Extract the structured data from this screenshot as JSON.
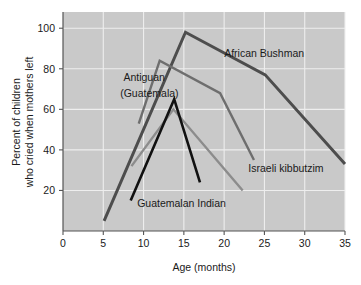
{
  "chart_data": {
    "type": "line",
    "title": "",
    "xlabel": "Age (months)",
    "ylabel": "Percent of children\nwho cried when mothers left",
    "ylabel_line1": "Percent of children",
    "ylabel_line2": "who cried when mothers left",
    "xlim": [
      0,
      35
    ],
    "ylim": [
      0,
      108
    ],
    "xticks": [
      0,
      5,
      10,
      15,
      20,
      25,
      30,
      35
    ],
    "xtick_labels": [
      "0",
      "5",
      "10",
      "15",
      "20",
      "25",
      "30",
      "35"
    ],
    "yticks": [
      20,
      40,
      60,
      80,
      100
    ],
    "ytick_labels": [
      "20",
      "40",
      "60",
      "80",
      "100"
    ],
    "grid": "both",
    "legend_position": "inline-annotations",
    "plot_background": "#c9c9c9",
    "series": [
      {
        "name": "African Bushman",
        "color": "#4d4d4d",
        "width": 3.0,
        "points": [
          [
            5.1,
            5
          ],
          [
            15.2,
            98
          ],
          [
            25.1,
            77
          ],
          [
            35.0,
            33
          ]
        ]
      },
      {
        "name": "Antiguan (Guatemala)",
        "color": "#6e6e6e",
        "width": 2.4,
        "points": [
          [
            9.4,
            53
          ],
          [
            12.0,
            84
          ],
          [
            19.5,
            68
          ],
          [
            23.7,
            35
          ]
        ]
      },
      {
        "name": "Israeli kibbutzim",
        "color": "#8c8c8c",
        "width": 2.4,
        "points": [
          [
            8.5,
            32
          ],
          [
            13.7,
            60
          ],
          [
            22.3,
            20
          ]
        ]
      },
      {
        "name": "Guatemalan Indian",
        "color": "#111111",
        "width": 2.6,
        "points": [
          [
            8.4,
            15
          ],
          [
            13.8,
            65
          ],
          [
            17.0,
            24
          ]
        ]
      }
    ],
    "annotations": [
      {
        "text": "African Bushman",
        "x": 20.0,
        "y": 86
      },
      {
        "text": "Antiguan",
        "x": 7.5,
        "y": 74
      },
      {
        "text": "(Guatemala)",
        "x": 7.1,
        "y": 66
      },
      {
        "text": "Israeli kibbutzim",
        "x": 23.0,
        "y": 29
      },
      {
        "text": "Guatemalan Indian",
        "x": 9.2,
        "y": 12
      }
    ]
  }
}
